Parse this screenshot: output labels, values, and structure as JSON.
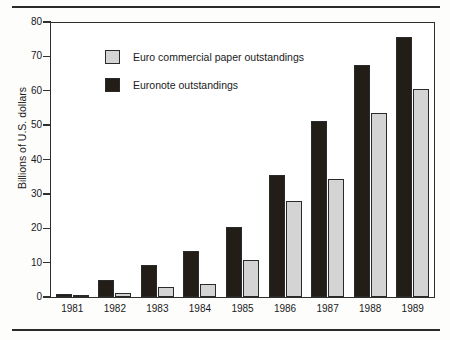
{
  "chart_data": {
    "type": "bar",
    "title": "",
    "subtitle": "",
    "xlabel": "",
    "ylabel": "Billions of U.S. dollars",
    "categories": [
      "1981",
      "1982",
      "1983",
      "1984",
      "1985",
      "1986",
      "1987",
      "1988",
      "1989"
    ],
    "series": [
      {
        "name": "Euronote outstandings",
        "color": "#231d17",
        "values": [
          0.8,
          5.0,
          9.2,
          13.4,
          20.5,
          35.6,
          51.3,
          67.5,
          75.7
        ]
      },
      {
        "name": "Euro commercial paper outstandings",
        "color": "#d4d4d4",
        "values": [
          0.1,
          1.2,
          2.8,
          3.9,
          10.8,
          27.8,
          34.2,
          53.4,
          60.5
        ]
      }
    ],
    "ylim": [
      0,
      80
    ],
    "yticks": [
      0,
      10,
      20,
      30,
      40,
      50,
      60,
      70,
      80
    ],
    "ytick_labels": [
      "0",
      "10",
      "20",
      "30",
      "40",
      "50",
      "60",
      "70",
      "80"
    ],
    "grid": false,
    "legend_position": "upper-left-inside",
    "bar_order": [
      "Euronote outstandings",
      "Euro commercial paper outstandings"
    ]
  },
  "legend": {
    "entries": [
      {
        "label": "Euro commercial paper outstandings",
        "swatch": "light"
      },
      {
        "label": "Euronote outstandings",
        "swatch": "dark"
      }
    ]
  }
}
